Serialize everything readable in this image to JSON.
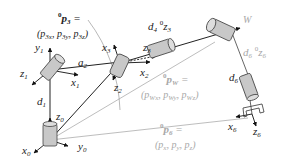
{
  "diagram": {
    "type": "robot-arm-kinematics",
    "colors": {
      "line_dark": "#222222",
      "line_light": "#b0b0b0",
      "joint_fill": "#c8c8c8",
      "joint_stroke": "#444444",
      "label_dark": "#222222",
      "label_grey": "#a8a8a8"
    },
    "labels": {
      "p3_title": "p",
      "p3_title_sub": "3",
      "p3_title_sup": "0",
      "p3_eq": " =",
      "p3_coords_open": "(",
      "p3_coords": "p3x, p3y, p3z",
      "p3x": "p",
      "p3x_sub": "3x",
      "p3y": "p",
      "p3y_sub": "3y",
      "p3z": "p",
      "p3z_sub": "3z",
      "y1": "y",
      "y1_sub": "1",
      "z1": "z",
      "z1_sub": "1",
      "x1": "x",
      "x1_sub": "1",
      "a2": "a",
      "a2_sub": "2",
      "d1": "d",
      "d1_sub": "1",
      "z0": "z",
      "z0_sub": "0",
      "x0": "x",
      "x0_sub": "0",
      "y0": "y",
      "y0_sub": "0",
      "x3": "x",
      "x3_sub": "3",
      "z3": "z",
      "z3_sub": "3",
      "x2": "x",
      "x2_sub": "2",
      "z2": "z",
      "z2_sub": "2",
      "d4z3": "d",
      "d4z3_sub": "4",
      "d4z3_sup": "0",
      "d4z3_z": "z",
      "d4z3_zsub": "3",
      "W": "W",
      "d6z6": "d",
      "d6z6_sub": "6",
      "d6z6_sup": "0",
      "d6z6_z": "z",
      "d6z6_zsub": "6",
      "d6": "d",
      "d6_sub": "6",
      "pW_title": "p",
      "pW_title_sub": "W",
      "pW_title_sup": "0",
      "pW_eq": " =",
      "pWx": "p",
      "pWx_sub": "Wx",
      "pWy": "p",
      "pWy_sub": "Wy",
      "pWz": "p",
      "pWz_sub": "Wz",
      "x6": "x",
      "x6_sub": "6",
      "z6": "z",
      "z6_sub": "6",
      "p6_title": "p",
      "p6_title_sub": "6",
      "p6_title_sup": "0",
      "p6_eq": " =",
      "px": "p",
      "px_sub": "x",
      "py": "p",
      "py_sub": "y",
      "pz": "p",
      "pz_sub": "z",
      "paren_open": "(",
      "paren_close": ")",
      "comma": ", "
    }
  }
}
